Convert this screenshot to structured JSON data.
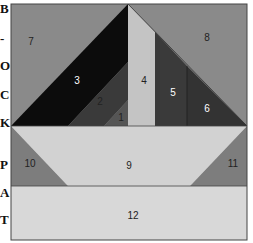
{
  "side_letters": [
    "B",
    "-",
    "O",
    "C",
    "K",
    "P",
    "A",
    "T"
  ],
  "colors": {
    "background_gray": "#8a8a8a",
    "black": "#0c0c0c",
    "dark_gray": "#3a3a3a",
    "mid_dark": "#555555",
    "light_gray": "#c4c4c4",
    "pale": "#d8d8d8",
    "medium_gray": "#7d7d7d",
    "border": "#444444"
  },
  "pieces": [
    {
      "id": "1",
      "label": "1"
    },
    {
      "id": "2",
      "label": "2"
    },
    {
      "id": "3",
      "label": "3"
    },
    {
      "id": "4",
      "label": "4"
    },
    {
      "id": "5",
      "label": "5"
    },
    {
      "id": "6",
      "label": "6"
    },
    {
      "id": "7",
      "label": "7"
    },
    {
      "id": "8",
      "label": "8"
    },
    {
      "id": "9",
      "label": "9"
    },
    {
      "id": "10",
      "label": "10"
    },
    {
      "id": "11",
      "label": "11"
    },
    {
      "id": "12",
      "label": "12"
    }
  ]
}
